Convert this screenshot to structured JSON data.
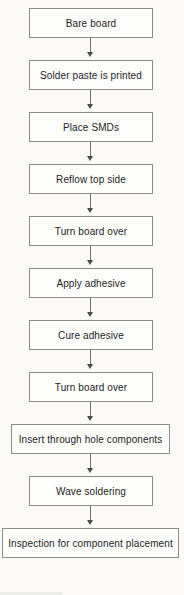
{
  "diagram": {
    "orientation": "vertical top-to-bottom",
    "background_color": "#fbfaf8",
    "box_border_color": "#8c8c8c",
    "box_fill_color": "#fdfdfc",
    "connector_color": "#6f6f6f",
    "text_color": "#1e1e1e",
    "steps": [
      {
        "label": "Bare board",
        "width": "narrow"
      },
      {
        "label": "Solder paste is printed",
        "width": "narrow"
      },
      {
        "label": "Place SMDs",
        "width": "narrow"
      },
      {
        "label": "Reflow top side",
        "width": "narrow"
      },
      {
        "label": "Turn board over",
        "width": "narrow"
      },
      {
        "label": "Apply adhesive",
        "width": "narrow"
      },
      {
        "label": "Cure adhesive",
        "width": "narrow"
      },
      {
        "label": "Turn board over",
        "width": "narrow"
      },
      {
        "label": "Insert through hole components",
        "width": "medium"
      },
      {
        "label": "Wave soldering",
        "width": "narrow"
      },
      {
        "label": "Inspection for component placement",
        "width": "wide"
      }
    ],
    "connector_count": 10,
    "connector_glyph": "arrow-down"
  }
}
